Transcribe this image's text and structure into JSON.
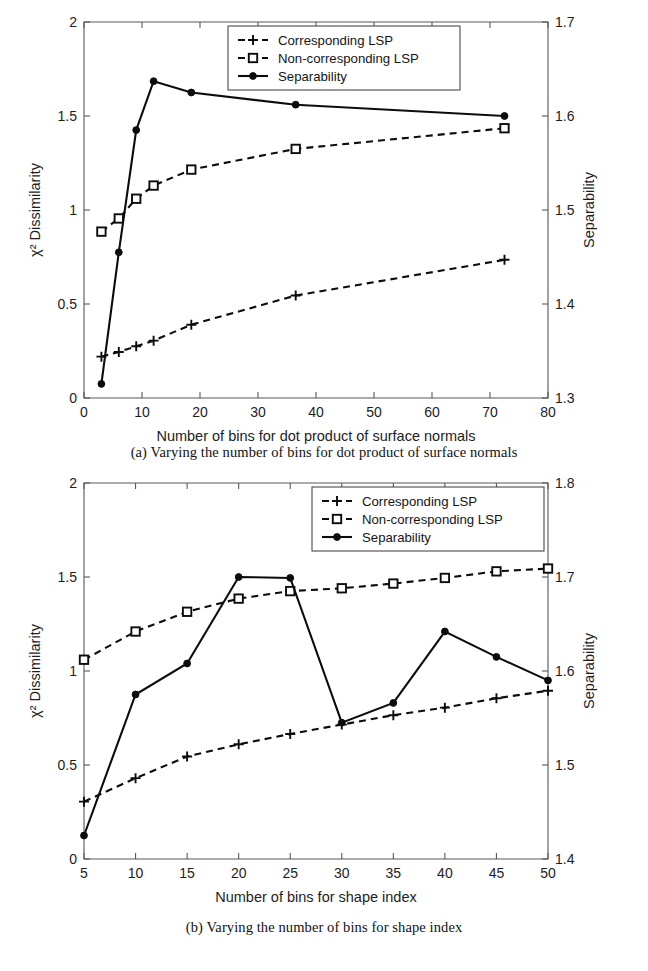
{
  "figure": {
    "panels": [
      {
        "id": "a",
        "caption": "(a) Varying the number of bins for dot product of surface normals",
        "chart_data": {
          "type": "line",
          "title": "",
          "xlabel": "Number of bins for dot product of surface normals",
          "ylabel": "χ² Dissimilarity",
          "y2label": "Separability",
          "xlim": [
            0,
            80
          ],
          "ylim": [
            0,
            2
          ],
          "y2lim": [
            1.3,
            1.7
          ],
          "xticks": [
            0,
            10,
            20,
            30,
            40,
            50,
            60,
            70,
            80
          ],
          "yticks": [
            0,
            0.5,
            1,
            1.5,
            2
          ],
          "y2ticks": [
            1.3,
            1.4,
            1.5,
            1.6,
            1.7
          ],
          "grid": false,
          "legend_position": "top-center",
          "x": [
            3,
            6,
            9,
            12,
            18.5,
            36.5,
            72.5
          ],
          "series": [
            {
              "name": "Corresponding LSP",
              "axis": "left",
              "style": "dashed",
              "marker": "plus",
              "values": [
                0.22,
                0.245,
                0.275,
                0.305,
                0.39,
                0.545,
                0.735
              ]
            },
            {
              "name": "Non-corresponding LSP",
              "axis": "left",
              "style": "dashed",
              "marker": "square",
              "values": [
                0.885,
                0.955,
                1.06,
                1.13,
                1.215,
                1.325,
                1.435
              ]
            },
            {
              "name": "Separability",
              "axis": "right",
              "style": "solid",
              "marker": "dot",
              "values": [
                1.315,
                1.455,
                1.585,
                1.637,
                1.625,
                1.612,
                1.6
              ]
            }
          ]
        }
      },
      {
        "id": "b",
        "caption": "(b) Varying the number of bins for shape index",
        "chart_data": {
          "type": "line",
          "title": "",
          "xlabel": "Number of bins for shape index",
          "ylabel": "χ² Dissimilarity",
          "y2label": "Separability",
          "xlim": [
            5,
            50
          ],
          "ylim": [
            0,
            2
          ],
          "y2lim": [
            1.4,
            1.8
          ],
          "xticks": [
            5,
            10,
            15,
            20,
            25,
            30,
            35,
            40,
            45,
            50
          ],
          "yticks": [
            0,
            0.5,
            1,
            1.5,
            2
          ],
          "y2ticks": [
            1.4,
            1.5,
            1.6,
            1.7,
            1.8
          ],
          "grid": false,
          "legend_position": "top-right",
          "x": [
            5,
            10,
            15,
            20,
            25,
            30,
            35,
            40,
            45,
            50
          ],
          "series": [
            {
              "name": "Corresponding LSP",
              "axis": "left",
              "style": "dashed",
              "marker": "plus",
              "values": [
                0.305,
                0.43,
                0.545,
                0.61,
                0.665,
                0.715,
                0.765,
                0.805,
                0.855,
                0.895
              ]
            },
            {
              "name": "Non-corresponding LSP",
              "axis": "left",
              "style": "dashed",
              "marker": "square",
              "values": [
                1.06,
                1.21,
                1.315,
                1.385,
                1.425,
                1.44,
                1.465,
                1.495,
                1.53,
                1.545
              ]
            },
            {
              "name": "Separability",
              "axis": "right",
              "style": "solid",
              "marker": "dot",
              "values": [
                1.425,
                1.575,
                1.608,
                1.7,
                1.699,
                1.545,
                1.566,
                1.642,
                1.615,
                1.59
              ]
            }
          ]
        }
      }
    ]
  },
  "bottom_partial_text": " "
}
